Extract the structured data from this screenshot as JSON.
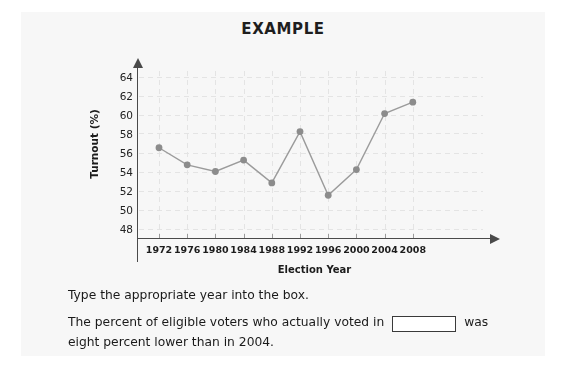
{
  "card": {
    "title": "EXAMPLE",
    "background": "#f7f7f7"
  },
  "chart_data": {
    "type": "line",
    "title": "EXAMPLE",
    "xlabel": "Election Year",
    "ylabel": "Turnout (%)",
    "categories": [
      "1972",
      "1976",
      "1980",
      "1984",
      "1988",
      "1992",
      "1996",
      "2000",
      "2004",
      "2008"
    ],
    "values": [
      56.5,
      54.7,
      54.0,
      55.2,
      52.8,
      58.2,
      51.5,
      54.2,
      60.1,
      61.3
    ],
    "ylim": [
      47,
      65
    ],
    "yticks": [
      "64",
      "62",
      "60",
      "58",
      "56",
      "54",
      "52",
      "50",
      "48"
    ],
    "ytick_values": [
      64,
      62,
      60,
      58,
      56,
      54,
      52,
      50,
      48
    ],
    "grid": "faint dashed",
    "legend": "none",
    "marker_color": "#8c8c8c",
    "line_color": "#9b9b9b",
    "axis_color": "#4a4a4a"
  },
  "question": {
    "instruction": "Type the appropriate year into the box.",
    "prompt_before": "The percent of eligible voters who actually voted in",
    "prompt_after": "was eight percent lower than in 2004.",
    "answer_value": "",
    "answer_placeholder": ""
  }
}
